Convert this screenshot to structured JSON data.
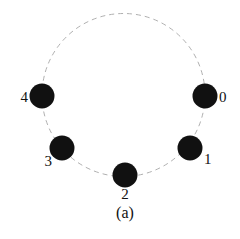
{
  "figure": {
    "caption": "(a)",
    "caption_x": 125,
    "caption_y": 213,
    "background_color": "#ffffff"
  },
  "chart_data": {
    "type": "scatter",
    "title": "(a)",
    "subtitle": "",
    "xlabel": "",
    "ylabel": "",
    "grid": false,
    "legend": null,
    "ring": {
      "shape": "circle",
      "center_x": 123.5,
      "center_y": 95,
      "radius": 81.5,
      "stroke_color": "#b0b0b0",
      "stroke_width": 1,
      "dash_pattern": "5 4",
      "fill": "none"
    },
    "node_style": {
      "fill_color": "#111111",
      "radius": 12.5
    },
    "categories": [
      "0",
      "1",
      "2",
      "3",
      "4"
    ],
    "points": [
      {
        "label": "0",
        "x": 205,
        "y": 96,
        "angle_deg": 0,
        "label_x": 219,
        "label_y": 97,
        "label_anchor": "left"
      },
      {
        "label": "1",
        "x": 190,
        "y": 148,
        "angle_deg": 320,
        "label_x": 204,
        "label_y": 159,
        "label_anchor": "left"
      },
      {
        "label": "2",
        "x": 125,
        "y": 175,
        "angle_deg": 270,
        "label_x": 125,
        "label_y": 194,
        "label_anchor": "center"
      },
      {
        "label": "3",
        "x": 62,
        "y": 148,
        "angle_deg": 220,
        "label_x": 52,
        "label_y": 161,
        "label_anchor": "right"
      },
      {
        "label": "4",
        "x": 42,
        "y": 96,
        "angle_deg": 180,
        "label_x": 28,
        "label_y": 97,
        "label_anchor": "right"
      }
    ]
  }
}
